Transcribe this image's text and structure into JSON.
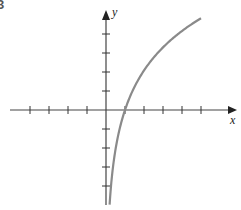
{
  "problem_number": "3",
  "chart_data": {
    "type": "line",
    "title": "",
    "xlabel": "x",
    "ylabel": "y",
    "x_ticks": [
      -4,
      -3,
      -2,
      -1,
      1,
      2,
      3,
      4,
      5
    ],
    "y_ticks": [
      -4,
      -3,
      -2,
      -1,
      1,
      2,
      3,
      4
    ],
    "tick_labels_shown": false,
    "grid": false,
    "xlim": [
      -5,
      6.9
    ],
    "ylim": [
      -5,
      5.2
    ],
    "series": [
      {
        "name": "logarithmic curve (approx. y = 3 ln x)",
        "color": "#8a8a8a",
        "x": [
          0.19,
          0.3,
          0.5,
          0.75,
          1,
          1.5,
          2,
          3,
          4,
          5
        ],
        "y": [
          -5.0,
          -3.6,
          -2.1,
          -0.9,
          0,
          1.2,
          2.1,
          3.3,
          4.2,
          4.8
        ]
      }
    ],
    "annotations": [
      "x-intercept at (1, 0)",
      "vertical asymptote x = 0"
    ]
  }
}
